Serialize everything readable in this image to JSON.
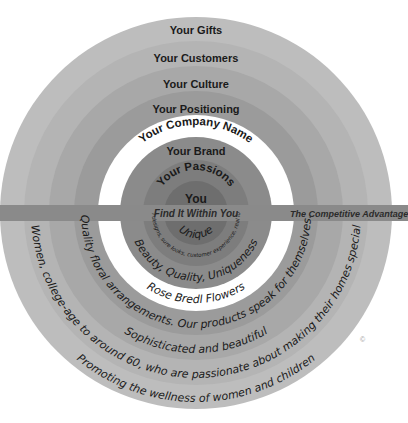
{
  "diagram": {
    "center_x": 196,
    "center_y": 213,
    "copyright_symbol": "©"
  },
  "band": {
    "left_label": "Find It Within You",
    "right_label": "The Competitive Advantage",
    "color": "#8a8a8a"
  },
  "colors": {
    "ring_1_you": "#6e6e6e",
    "ring_2_passions": "#7d7d7d",
    "ring_3_brand": "#8b8b8b",
    "ring_4_company_name": "#ffffff",
    "ring_5_positioning": "#9b9b9b",
    "ring_6_culture": "#a8a8a8",
    "ring_7_customers": "#b4b4b4",
    "ring_8_gifts": "#bdbdbd",
    "text_dark": "#1a1a1a",
    "background": "#ffffff"
  },
  "rings": [
    {
      "key": "gifts",
      "label": "Your Gifts",
      "radius": 196,
      "fill": "#bdbdbd",
      "label_y": 34
    },
    {
      "key": "customers",
      "label": "Your Customers",
      "radius": 172,
      "fill": "#b4b4b4",
      "label_y": 62
    },
    {
      "key": "culture",
      "label": "Your Culture",
      "radius": 147,
      "fill": "#a8a8a8",
      "label_y": 88
    },
    {
      "key": "positioning",
      "label": "Your Positioning",
      "radius": 122,
      "fill": "#9b9b9b",
      "label_y": 113
    },
    {
      "key": "company_name",
      "label": "Your Company Name",
      "radius": 98,
      "fill": "#ffffff",
      "label_y": 138
    },
    {
      "key": "brand",
      "label": "Your Brand",
      "radius": 76,
      "fill": "#8b8b8b",
      "label_y": 155
    },
    {
      "key": "passions",
      "label": "Your Passions",
      "radius": 53,
      "fill": "#7d7d7d",
      "label_y": 182
    },
    {
      "key": "you",
      "label": "You",
      "radius": 32,
      "fill": "#6e6e6e",
      "label_y": 203
    }
  ],
  "script_texts": [
    {
      "key": "unique",
      "text": "Unique",
      "radius": 25
    },
    {
      "key": "brand_promise",
      "text": "Real designs, sure looks, customer experience, real looks",
      "radius": 44
    },
    {
      "key": "values",
      "text": "Beauty, Quality, Uniqueness",
      "radius": 68
    },
    {
      "key": "company",
      "text": "Rose Bredl Flowers",
      "radius": 90
    },
    {
      "key": "positioning_statement",
      "text": "Quality floral arrangements. Our products speak for themselves.",
      "radius": 115
    },
    {
      "key": "culture_statement",
      "text": "Sophisticated and beautiful",
      "radius": 140
    },
    {
      "key": "customers_statement",
      "text": "Women, college-age to around 60, who are passionate about making their homes special",
      "radius": 165
    },
    {
      "key": "gifts_statement",
      "text": "Promoting the wellness of women and children",
      "radius": 189
    }
  ]
}
